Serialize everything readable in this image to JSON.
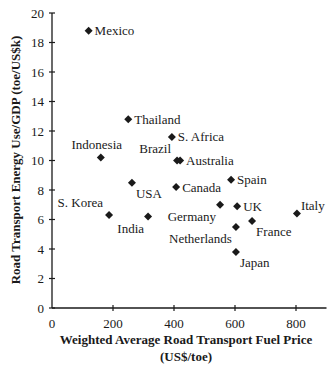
{
  "chart_data": {
    "type": "scatter",
    "title": "",
    "xlabel": "Weighted Average Road Transport Fuel Price",
    "xlabel_units": "(US$/toe)",
    "ylabel": "Road Transport Energy Use/GDP (toe/US$k)",
    "xlim": [
      0,
      900
    ],
    "ylim": [
      0,
      20
    ],
    "x_ticks": [
      0,
      200,
      400,
      600,
      800
    ],
    "y_ticks": [
      0,
      2,
      4,
      6,
      8,
      10,
      12,
      14,
      16,
      18,
      20
    ],
    "grid": false,
    "legend": null,
    "marker": "diamond",
    "marker_color": "#1a1a1a",
    "points": [
      {
        "label": "Mexico",
        "x": 120,
        "y": 18.8,
        "label_pos": "right"
      },
      {
        "label": "Thailand",
        "x": 250,
        "y": 12.8,
        "label_pos": "right"
      },
      {
        "label": "S. Africa",
        "x": 393,
        "y": 11.6,
        "label_pos": "right"
      },
      {
        "label": "Indonesia",
        "x": 160,
        "y": 10.2,
        "label_pos": "above"
      },
      {
        "label": "Brazil",
        "x": 410,
        "y": 10.0,
        "label_pos": "upper-left"
      },
      {
        "label": "Australia",
        "x": 420,
        "y": 10.0,
        "label_pos": "right"
      },
      {
        "label": "Spain",
        "x": 587,
        "y": 8.7,
        "label_pos": "right"
      },
      {
        "label": "USA",
        "x": 262,
        "y": 8.5,
        "label_pos": "lower-right"
      },
      {
        "label": "Canada",
        "x": 407,
        "y": 8.2,
        "label_pos": "right"
      },
      {
        "label": "Germany",
        "x": 551,
        "y": 7.0,
        "label_pos": "lower-left"
      },
      {
        "label": "UK",
        "x": 607,
        "y": 6.9,
        "label_pos": "right"
      },
      {
        "label": "Italy",
        "x": 803,
        "y": 6.4,
        "label_pos": "upper-right"
      },
      {
        "label": "S. Korea",
        "x": 187,
        "y": 6.3,
        "label_pos": "upper-left"
      },
      {
        "label": "India",
        "x": 315,
        "y": 6.2,
        "label_pos": "lower-left"
      },
      {
        "label": "France",
        "x": 656,
        "y": 5.9,
        "label_pos": "lower-right"
      },
      {
        "label": "Netherlands",
        "x": 603,
        "y": 5.5,
        "label_pos": "lower-left"
      },
      {
        "label": "Japan",
        "x": 603,
        "y": 3.8,
        "label_pos": "lower-right"
      }
    ]
  }
}
